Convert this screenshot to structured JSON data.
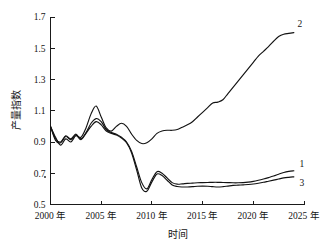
{
  "chart_data": {
    "type": "line",
    "title": "",
    "xlabel": "时间",
    "ylabel": "产量指数",
    "xlim": [
      2000,
      2025
    ],
    "ylim": [
      0.5,
      1.7
    ],
    "grid": false,
    "legend_position": "inline-right-end",
    "x_tick_labels": [
      "2000 年",
      "2005 年",
      "2010 年",
      "2015 年",
      "2020 年",
      "2025 年"
    ],
    "x_ticks": [
      2000,
      2005,
      2010,
      2015,
      2020,
      2025
    ],
    "y_tick_labels": [
      "0.5",
      "0.7",
      "0.9",
      "1.1",
      "1.3",
      "1.5",
      "1.7"
    ],
    "y_ticks": [
      0.5,
      0.7,
      0.9,
      1.1,
      1.3,
      1.5,
      1.7
    ],
    "x": [
      2000,
      2000.5,
      2001,
      2001.5,
      2002,
      2002.5,
      2003,
      2003.5,
      2004,
      2004.5,
      2005,
      2005.5,
      2006,
      2006.5,
      2007,
      2007.5,
      2008,
      2008.5,
      2009,
      2009.5,
      2010,
      2010.5,
      2011,
      2011.5,
      2012,
      2012.5,
      2013,
      2013.5,
      2014,
      2014.5,
      2015,
      2015.5,
      2016,
      2016.5,
      2017,
      2017.5,
      2018,
      2018.5,
      2019,
      2019.5,
      2020,
      2020.5,
      2021,
      2021.5,
      2022,
      2022.5,
      2023,
      2023.5,
      2024
    ],
    "series": [
      {
        "name": "1",
        "label": "1",
        "values": [
          1.0,
          0.92,
          0.9,
          0.94,
          0.92,
          0.95,
          0.92,
          0.96,
          1.02,
          1.05,
          1.03,
          0.98,
          0.96,
          0.95,
          0.93,
          0.9,
          0.84,
          0.74,
          0.64,
          0.6,
          0.66,
          0.71,
          0.7,
          0.67,
          0.64,
          0.63,
          0.632,
          0.635,
          0.637,
          0.639,
          0.64,
          0.641,
          0.642,
          0.642,
          0.641,
          0.64,
          0.639,
          0.639,
          0.64,
          0.643,
          0.648,
          0.655,
          0.663,
          0.672,
          0.682,
          0.694,
          0.705,
          0.712,
          0.716
        ]
      },
      {
        "name": "2",
        "label": "2",
        "values": [
          1.0,
          0.93,
          0.88,
          0.92,
          0.9,
          0.94,
          0.93,
          0.99,
          1.08,
          1.13,
          1.06,
          0.99,
          0.97,
          1.0,
          1.02,
          1.0,
          0.95,
          0.91,
          0.89,
          0.895,
          0.92,
          0.955,
          0.97,
          0.975,
          0.975,
          0.98,
          0.995,
          1.01,
          1.03,
          1.06,
          1.09,
          1.12,
          1.15,
          1.155,
          1.17,
          1.21,
          1.25,
          1.29,
          1.33,
          1.37,
          1.41,
          1.45,
          1.48,
          1.51,
          1.545,
          1.575,
          1.59,
          1.595,
          1.6
        ]
      },
      {
        "name": "3",
        "label": "3",
        "values": [
          1.0,
          0.91,
          0.895,
          0.935,
          0.915,
          0.945,
          0.915,
          0.955,
          1.0,
          1.03,
          1.01,
          0.97,
          0.955,
          0.945,
          0.925,
          0.895,
          0.83,
          0.72,
          0.605,
          0.585,
          0.645,
          0.695,
          0.685,
          0.655,
          0.625,
          0.615,
          0.612,
          0.612,
          0.614,
          0.617,
          0.618,
          0.617,
          0.614,
          0.612,
          0.614,
          0.618,
          0.622,
          0.624,
          0.626,
          0.628,
          0.631,
          0.636,
          0.642,
          0.649,
          0.656,
          0.663,
          0.67,
          0.674,
          0.677
        ]
      }
    ],
    "series_end_labels": [
      {
        "name": "1",
        "text": "1"
      },
      {
        "name": "2",
        "text": "2"
      },
      {
        "name": "3",
        "text": "3"
      }
    ]
  }
}
